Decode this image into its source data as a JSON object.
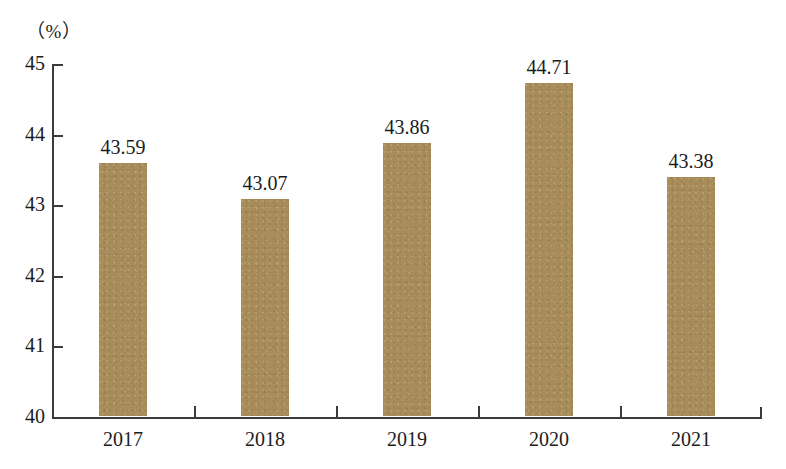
{
  "chart_data": {
    "type": "bar",
    "title": "",
    "subtitle": "",
    "xlabel": "",
    "ylabel": "",
    "unit_label": "（%）",
    "categories": [
      "2017",
      "2018",
      "2019",
      "2020",
      "2021"
    ],
    "values": [
      43.59,
      43.07,
      43.86,
      44.71,
      43.38
    ],
    "value_labels": [
      "43.59",
      "43.07",
      "43.86",
      "44.71",
      "43.38"
    ],
    "ylim": [
      40,
      45
    ],
    "ytick_labels": [
      "45",
      "44",
      "43",
      "42",
      "41",
      "40"
    ],
    "yticks": [
      45,
      44,
      43,
      42,
      41,
      40
    ],
    "grid": false,
    "legend": false,
    "legend_position": "none",
    "series": [
      {
        "name": "value",
        "values": [
          43.59,
          43.07,
          43.86,
          44.71,
          43.38
        ]
      }
    ]
  },
  "style": {
    "bar_color": "#a88c5a",
    "axis_color": "#3b3b3b",
    "text_color": "#1c1c1c",
    "background_color": "#ffffff"
  }
}
